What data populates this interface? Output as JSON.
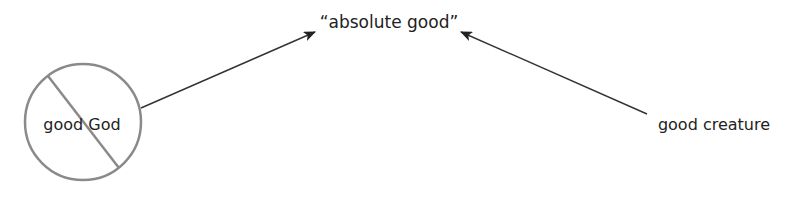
{
  "diagram": {
    "nodes": {
      "absolute_good": {
        "label": "“absolute good”"
      },
      "good_god": {
        "label": "good God",
        "crossed_out": true
      },
      "good_creature": {
        "label": "good creature"
      }
    },
    "edges": [
      {
        "from": "good God",
        "to": "“absolute good”"
      },
      {
        "from": "good creature",
        "to": "“absolute good”"
      }
    ],
    "colors": {
      "circle": "#8a8a8a",
      "arrow": "#333333",
      "text": "#222222"
    }
  }
}
